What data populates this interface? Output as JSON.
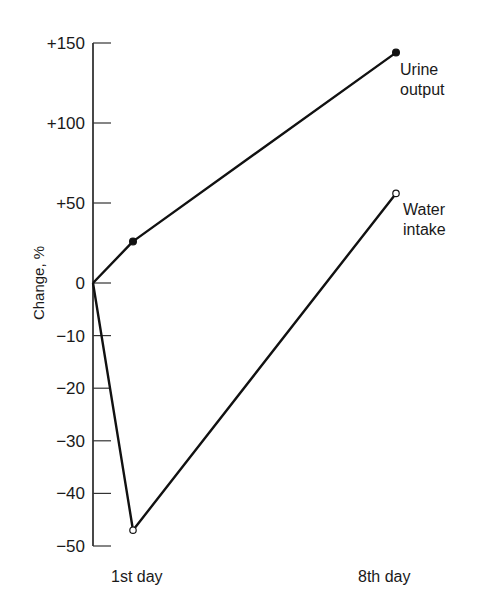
{
  "chart_data": {
    "type": "line",
    "title": "",
    "xlabel": "",
    "ylabel": "Change, %",
    "categories": [
      "0",
      "1st day",
      "8th day"
    ],
    "x_tick_labels": [
      "1st day",
      "8th day"
    ],
    "y_ticks": [
      {
        "value": 150,
        "label": "+150"
      },
      {
        "value": 100,
        "label": "+100"
      },
      {
        "value": 50,
        "label": "+50"
      },
      {
        "value": 0,
        "label": "0"
      },
      {
        "value": -10,
        "label": "−10"
      },
      {
        "value": -20,
        "label": "−20"
      },
      {
        "value": -30,
        "label": "−30"
      },
      {
        "value": -40,
        "label": "−40"
      },
      {
        "value": -50,
        "label": "−50"
      }
    ],
    "ylim": [
      -50,
      150
    ],
    "y_scale_note": "broken scale: 50-unit spacing above 0, 10-unit spacing below 0",
    "grid": false,
    "legend": "inline labels at line ends",
    "series": [
      {
        "name": "Urine output",
        "label_lines": [
          "Urine",
          "output"
        ],
        "marker": "filled-circle",
        "values": [
          0,
          26,
          144
        ]
      },
      {
        "name": "Water intake",
        "label_lines": [
          "Water",
          "intake"
        ],
        "marker": "open-circle",
        "values": [
          0,
          -47,
          56
        ]
      }
    ]
  }
}
